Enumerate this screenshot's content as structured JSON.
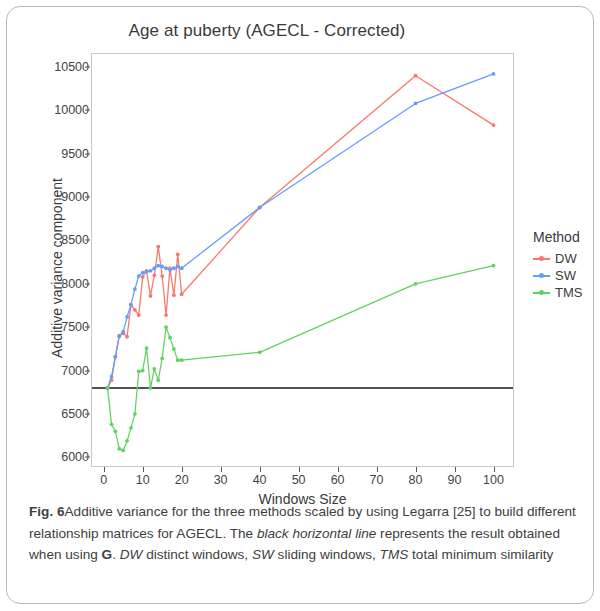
{
  "figure": {
    "title": "Age at puberty (AGECL - Corrected)",
    "caption_label": "Fig. 6",
    "caption_line1": "Additive variance for the three methods scaled by using",
    "caption_line2": "Legarra [25] to build different relationship matrices for AGECL. The",
    "caption_line3a": "black horizontal line",
    "caption_line3b": " represents the result obtained when using ",
    "caption_line3c": "G",
    "caption_line3d": ". ",
    "caption_line3e": "DW",
    "caption_line4a": "distinct windows, ",
    "caption_line4b": "SW",
    "caption_line4c": " sliding windows, ",
    "caption_line4d": "TMS",
    "caption_line4e": " total minimum similarity"
  },
  "legend": {
    "title": "Method",
    "entries": [
      {
        "label": "DW",
        "color": "#F8766D"
      },
      {
        "label": "SW",
        "color": "#619CFF"
      },
      {
        "label": "TMS",
        "color": "#5FD35F"
      }
    ]
  },
  "chart_data": {
    "type": "line",
    "title": "Age at puberty (AGECL - Corrected)",
    "xlabel": "Windows Size",
    "ylabel": "Additive variance component",
    "xlim": [
      -3,
      105
    ],
    "ylim": [
      5900,
      10650
    ],
    "xticks": [
      0,
      10,
      20,
      30,
      40,
      50,
      60,
      70,
      80,
      90,
      100
    ],
    "yticks": [
      6000,
      6500,
      7000,
      7500,
      8000,
      8500,
      9000,
      9500,
      10000,
      10500
    ],
    "grid": false,
    "legend_position": "right",
    "annotations": [
      {
        "type": "hline",
        "label": "black horizontal line (result using G)",
        "y": 6800,
        "color": "#1a1a1a"
      }
    ],
    "series": [
      {
        "name": "DW",
        "color": "#F8766D",
        "x": [
          1,
          2,
          3,
          4,
          5,
          6,
          7,
          8,
          9,
          10,
          11,
          12,
          13,
          14,
          15,
          16,
          17,
          18,
          19,
          20,
          40,
          80,
          100
        ],
        "values": [
          6800,
          6890,
          7160,
          7400,
          7430,
          7390,
          7760,
          7700,
          7640,
          8080,
          8150,
          7860,
          8100,
          8430,
          8090,
          7640,
          8180,
          7870,
          8340,
          7880,
          8880,
          10400,
          9830
        ]
      },
      {
        "name": "SW",
        "color": "#619CFF",
        "x": [
          1,
          2,
          3,
          4,
          5,
          6,
          7,
          8,
          9,
          10,
          11,
          12,
          13,
          14,
          15,
          16,
          17,
          18,
          19,
          20,
          40,
          80,
          100
        ],
        "values": [
          6800,
          6930,
          7160,
          7400,
          7450,
          7620,
          7760,
          7940,
          8090,
          8130,
          8140,
          8150,
          8180,
          8210,
          8200,
          8180,
          8160,
          8180,
          8200,
          8180,
          8880,
          10080,
          10420
        ]
      },
      {
        "name": "TMS",
        "color": "#5FD35F",
        "x": [
          1,
          2,
          3,
          4,
          5,
          6,
          7,
          8,
          9,
          10,
          11,
          12,
          13,
          14,
          15,
          16,
          17,
          18,
          19,
          20,
          40,
          80,
          100
        ],
        "values": [
          6800,
          6380,
          6300,
          6100,
          6080,
          6190,
          6340,
          6500,
          6990,
          7000,
          7260,
          6800,
          7020,
          6890,
          7140,
          7500,
          7380,
          7250,
          7120,
          7120,
          7210,
          8000,
          8210
        ]
      }
    ]
  }
}
